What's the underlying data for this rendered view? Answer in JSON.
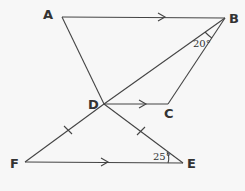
{
  "diagram": {
    "type": "geometry",
    "points": {
      "A": {
        "label": "A",
        "x": 62,
        "y": 17
      },
      "B": {
        "label": "B",
        "x": 225,
        "y": 18
      },
      "C": {
        "label": "C",
        "x": 168,
        "y": 104
      },
      "D": {
        "label": "D",
        "x": 104,
        "y": 104
      },
      "E": {
        "label": "E",
        "x": 183,
        "y": 163
      },
      "F": {
        "label": "F",
        "x": 25,
        "y": 162
      }
    },
    "segments": [
      "AB",
      "AD",
      "DB",
      "BC",
      "DC",
      "DF",
      "DE",
      "FE"
    ],
    "parallel_marks": [
      "AB",
      "DC",
      "FE"
    ],
    "equal_marks": [
      "DF",
      "DE"
    ],
    "angles": {
      "DBC": {
        "label": "20°"
      },
      "DEF": {
        "label": "25°"
      }
    }
  }
}
